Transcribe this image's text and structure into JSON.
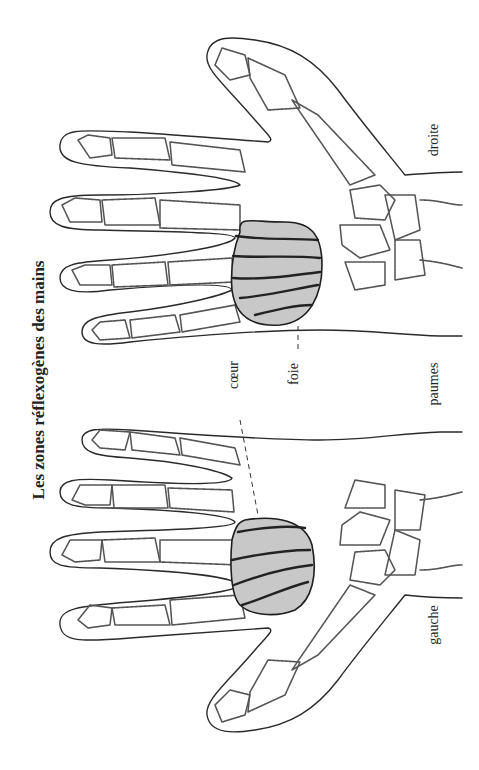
{
  "title": "Les zones réflexogènes des mains",
  "hands": {
    "right": {
      "label": "droite"
    },
    "left": {
      "label": "gauche"
    }
  },
  "caption_center": "paumes",
  "zones": [
    {
      "name": "foie",
      "label": "foie",
      "hand": "droite"
    },
    {
      "name": "coeur",
      "label": "cœur",
      "hand": "gauche"
    }
  ],
  "colors": {
    "zone_fill": "#c8c8c8",
    "outline": "#2a2a2a",
    "bone": "#555555",
    "background": "#ffffff"
  }
}
